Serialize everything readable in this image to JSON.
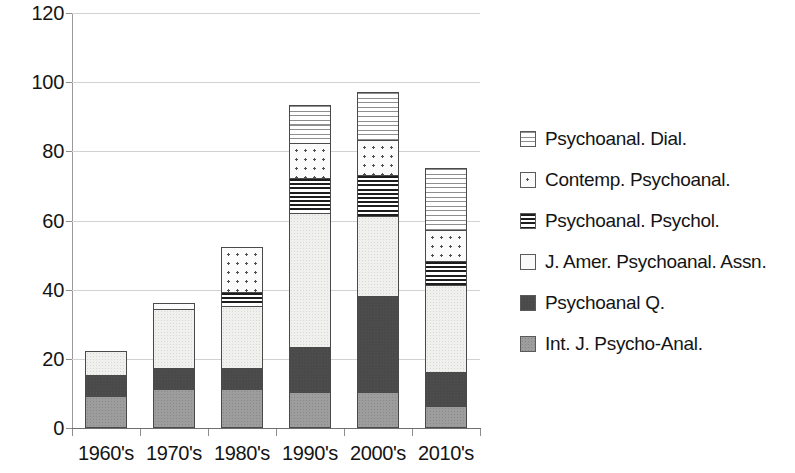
{
  "chart_data": {
    "type": "bar",
    "subtype": "stacked-column",
    "title": "",
    "xlabel": "",
    "ylabel": "",
    "ylim": [
      0,
      120
    ],
    "ytick_step": 20,
    "ytick_labels": [
      "0",
      "20",
      "40",
      "60",
      "80",
      "100",
      "120"
    ],
    "grid": true,
    "legend_position": "right",
    "categories": [
      "1960's",
      "1970's",
      "1980's",
      "1990's",
      "2000's",
      "2010's"
    ],
    "series": [
      {
        "name": "Int. J. Psycho-Anal.",
        "pattern": "solid-gray",
        "color": "#9d9d9d",
        "values": [
          9,
          11,
          11,
          10,
          10,
          6
        ]
      },
      {
        "name": "Psychoanal Q.",
        "pattern": "solid-dark",
        "color": "#4a4a4a",
        "values": [
          6,
          6,
          6,
          13,
          28,
          10
        ]
      },
      {
        "name": "J. Amer. Psychoanal. Assn.",
        "pattern": "light-stipple",
        "color": "#f0f0ee",
        "values": [
          7,
          17,
          18,
          39,
          23,
          25
        ]
      },
      {
        "name": "Psychoanal. Psychol.",
        "pattern": "dark-horizontal-stripes",
        "color": "#1d1d1d",
        "values": [
          0,
          0,
          4,
          10,
          12,
          7
        ]
      },
      {
        "name": "Contemp. Psychoanal.",
        "pattern": "dots",
        "color": "#4f4f4f",
        "values": [
          0,
          2,
          13,
          10,
          10,
          9
        ]
      },
      {
        "name": "Psychoanal. Dial.",
        "pattern": "light-horizontal-stripes",
        "color": "#8e8e8e",
        "values": [
          0,
          0,
          0,
          11,
          14,
          18
        ]
      }
    ],
    "totals": [
      22,
      36,
      52,
      93,
      97,
      75
    ]
  },
  "legend": {
    "items": [
      {
        "label": "Psychoanal. Dial.",
        "pattern": "light-horizontal-stripes"
      },
      {
        "label": "Contemp. Psychoanal.",
        "pattern": "dots"
      },
      {
        "label": "Psychoanal. Psychol.",
        "pattern": "dark-horizontal-stripes"
      },
      {
        "label": "J. Amer. Psychoanal. Assn.",
        "pattern": "plain-white"
      },
      {
        "label": "Psychoanal Q.",
        "pattern": "solid-dark"
      },
      {
        "label": "Int. J. Psycho-Anal.",
        "pattern": "solid-gray"
      }
    ]
  }
}
